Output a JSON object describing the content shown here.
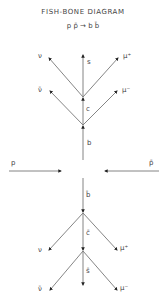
{
  "title": "FISH-BONE  DIAGRAM",
  "reaction": "p p̄ → b b̄",
  "beams": {
    "left_label": "p",
    "right_label": "p̄"
  },
  "upper_tree": {
    "quark_1": "b",
    "quark_2": "c",
    "quark_3": "s",
    "vertex_1_leptons": {
      "left": "ν̄",
      "right": "μ⁻"
    },
    "vertex_2_leptons": {
      "left": "ν",
      "right": "μ⁺"
    }
  },
  "lower_tree": {
    "quark_1": "b̄",
    "quark_2": "c̄",
    "quark_3": "s̄",
    "vertex_1_leptons": {
      "left": "ν",
      "right": "μ⁺"
    },
    "vertex_2_leptons": {
      "left": "ν̄",
      "right": "μ⁻"
    }
  },
  "colors": {
    "line": "#777777",
    "text": "#444444"
  }
}
